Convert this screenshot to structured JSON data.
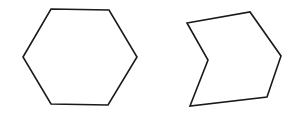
{
  "diagram": {
    "canvas": {
      "width": 302,
      "height": 118,
      "background": "#ffffff"
    },
    "stroke_color": "#1a1a1a",
    "stroke_width": 1.6,
    "fill": "none",
    "shapes": [
      {
        "name": "regular-hexagon",
        "type": "convex-hexagon",
        "points": [
          [
            51,
            9
          ],
          [
            109,
            10
          ],
          [
            137,
            57
          ],
          [
            108,
            105
          ],
          [
            51,
            104
          ],
          [
            23,
            57
          ]
        ]
      },
      {
        "name": "concave-hexagon",
        "type": "concave-hexagon",
        "points": [
          [
            187,
            23
          ],
          [
            250,
            12
          ],
          [
            281,
            56
          ],
          [
            267,
            97
          ],
          [
            190,
            106
          ],
          [
            208,
            60
          ]
        ]
      }
    ]
  }
}
